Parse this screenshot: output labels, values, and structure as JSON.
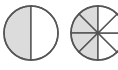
{
  "diagram": {
    "type": "fraction-circles",
    "colors": {
      "background": "#ffffff",
      "shaded_fill": "#dcdcdc",
      "unshaded_fill": "#ffffff",
      "stroke": "#555555"
    },
    "circles": [
      {
        "name": "halves-circle",
        "center": [
          31,
          33
        ],
        "radius": 27,
        "parts": 2,
        "shaded_parts": 1,
        "fraction": "1/2"
      },
      {
        "name": "eighths-circle",
        "center": [
          98,
          33
        ],
        "radius": 27,
        "parts": 8,
        "shaded_parts": 4,
        "fraction": "4/8"
      }
    ]
  }
}
